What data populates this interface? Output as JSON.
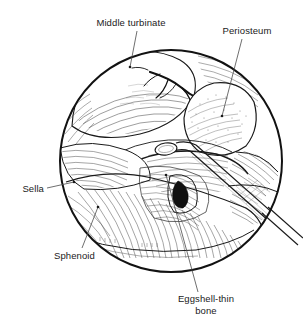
{
  "figure": {
    "type": "medical-line-illustration",
    "view_shape": "circle",
    "style": "pen-and-ink hatching",
    "colors": {
      "background": "#ffffff",
      "ink": "#1a1a1a",
      "hatch": "#3a3a3a",
      "leader": "#4a4a4a"
    },
    "viewport_circle": {
      "cx": 171,
      "cy": 161,
      "r": 112
    }
  },
  "labels": [
    {
      "id": "middle-turbinate",
      "text": "Middle turbinate",
      "align": "center",
      "x": 79,
      "y": 17,
      "w": 104,
      "leader": {
        "x1": 137,
        "y1": 31,
        "x2": 130,
        "y2": 67,
        "dot": true
      }
    },
    {
      "id": "periosteum",
      "text": "Periosteum",
      "align": "center",
      "x": 212,
      "y": 25,
      "w": 70,
      "leader": {
        "x1": 242,
        "y1": 39,
        "x2": 222,
        "y2": 116,
        "dot": true
      }
    },
    {
      "id": "sella",
      "text": "Sella",
      "align": "right",
      "x": 8,
      "y": 183,
      "w": 36,
      "leader": {
        "x1": 47,
        "y1": 188,
        "x2": 74,
        "y2": 182,
        "dot": true
      }
    },
    {
      "id": "sphenoid",
      "text": "Sphenoid",
      "align": "left",
      "x": 54,
      "y": 250,
      "w": 58,
      "leader": {
        "x1": 82,
        "y1": 248,
        "x2": 98,
        "y2": 207,
        "dot": true
      }
    },
    {
      "id": "eggshell-thin-bone",
      "text": "Eggshell-thin\nbone",
      "align": "center",
      "x": 163,
      "y": 293,
      "w": 86,
      "leader": {
        "x1": 198,
        "y1": 292,
        "x2": 166,
        "y2": 175,
        "dot": true
      }
    }
  ],
  "structures": [
    {
      "id": "middle-turbinate-body",
      "description": "Smooth lobed turbinate mass, upper left of field"
    },
    {
      "id": "vessels",
      "description": "Dark branching mucosal vessels across upper field"
    },
    {
      "id": "periosteum-flap",
      "description": "Rounded stippled periosteal flap, upper right"
    },
    {
      "id": "sphenoid-floor",
      "description": "Dense curved hatching forming sphenoid sinus floor"
    },
    {
      "id": "sella-wall",
      "description": "Hatched sellar wall, left of center"
    },
    {
      "id": "bone-defect",
      "description": "Dark teardrop opening in eggshell-thin bone"
    },
    {
      "id": "instrument",
      "description": "Long thin elevator crossing the field to lower right"
    },
    {
      "id": "instrument-tip-oval",
      "description": "Small oval ring at instrument working end"
    }
  ]
}
